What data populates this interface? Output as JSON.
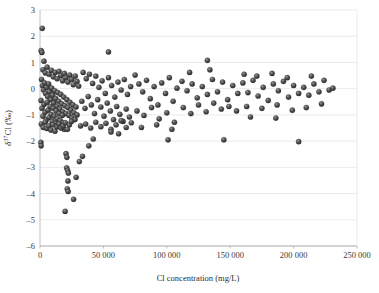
{
  "chart_data": {
    "type": "scatter",
    "title": "",
    "xlabel": "Cl  concentration (mg/L)",
    "ylabel": "δ³⁷Cl (‰)",
    "ylabel_parts": {
      "delta": "δ",
      "superscript": "37",
      "element": "Cl",
      "unit": "(‰)"
    },
    "xlim": [
      0,
      250000
    ],
    "ylim": [
      -6,
      3
    ],
    "xticks": [
      0,
      50000,
      100000,
      150000,
      200000,
      250000
    ],
    "xtick_labels": [
      "0",
      "50 000",
      "100 000",
      "150 000",
      "200 000",
      "250 000"
    ],
    "yticks": [
      3,
      2,
      1,
      0,
      -1,
      -2,
      -3,
      -4,
      -5,
      -6
    ],
    "ytick_labels": [
      "3",
      "2",
      "1",
      "0",
      "–1",
      "–2",
      "–3",
      "–4",
      "–5",
      "–6"
    ],
    "grid": {
      "horizontal": true,
      "vertical": false,
      "color": "#e2e2e2"
    },
    "legend": {
      "visible": false,
      "position": "none"
    },
    "marker": {
      "shape": "sphere",
      "size_px": 5.2,
      "fill": "#4a4a4a",
      "highlight": "#9a9a9a",
      "edge": "#262626"
    },
    "axis_color": "#b9b9b9",
    "series": [
      {
        "name": "samples",
        "points": [
          [
            1800,
            2.3
          ],
          [
            900,
            1.45
          ],
          [
            1500,
            1.38
          ],
          [
            3100,
            1.05
          ],
          [
            54000,
            1.4
          ],
          [
            132000,
            1.08
          ],
          [
            2300,
            0.72
          ],
          [
            4200,
            0.6
          ],
          [
            5600,
            0.82
          ],
          [
            7100,
            0.55
          ],
          [
            9000,
            0.7
          ],
          [
            10500,
            0.45
          ],
          [
            12000,
            0.62
          ],
          [
            13500,
            0.38
          ],
          [
            15000,
            0.66
          ],
          [
            16400,
            0.5
          ],
          [
            17800,
            0.3
          ],
          [
            19200,
            0.58
          ],
          [
            20500,
            0.42
          ],
          [
            22000,
            0.25
          ],
          [
            23500,
            0.52
          ],
          [
            25000,
            0.35
          ],
          [
            26300,
            0.15
          ],
          [
            27800,
            0.48
          ],
          [
            29200,
            0.28
          ],
          [
            30500,
            0.1
          ],
          [
            1200,
            0.35
          ],
          [
            2000,
            0.12
          ],
          [
            2800,
            -0.05
          ],
          [
            3600,
            0.22
          ],
          [
            4400,
            -0.18
          ],
          [
            5200,
            0.05
          ],
          [
            6000,
            -0.3
          ],
          [
            6800,
            0.18
          ],
          [
            7600,
            -0.12
          ],
          [
            8400,
            -0.42
          ],
          [
            9200,
            0.02
          ],
          [
            10000,
            -0.25
          ],
          [
            10800,
            -0.55
          ],
          [
            11600,
            -0.08
          ],
          [
            12400,
            -0.38
          ],
          [
            13200,
            -0.68
          ],
          [
            14000,
            -0.15
          ],
          [
            14800,
            -0.48
          ],
          [
            15600,
            -0.78
          ],
          [
            16400,
            -0.22
          ],
          [
            17200,
            -0.58
          ],
          [
            18000,
            -0.88
          ],
          [
            18800,
            -0.32
          ],
          [
            19600,
            -0.65
          ],
          [
            20400,
            -0.95
          ],
          [
            21200,
            -0.42
          ],
          [
            22000,
            -0.72
          ],
          [
            22800,
            -1.02
          ],
          [
            23600,
            -0.52
          ],
          [
            24400,
            -0.82
          ],
          [
            25200,
            -1.12
          ],
          [
            26000,
            -0.62
          ],
          [
            26800,
            -0.92
          ],
          [
            27600,
            -1.18
          ],
          [
            28400,
            -0.7
          ],
          [
            29200,
            -1.0
          ],
          [
            800,
            -0.45
          ],
          [
            1600,
            -0.75
          ],
          [
            2400,
            -1.05
          ],
          [
            3200,
            -0.6
          ],
          [
            4000,
            -0.9
          ],
          [
            4800,
            -1.2
          ],
          [
            5600,
            -0.52
          ],
          [
            6400,
            -0.82
          ],
          [
            7200,
            -1.1
          ],
          [
            8000,
            -0.68
          ],
          [
            8800,
            -0.98
          ],
          [
            9600,
            -1.25
          ],
          [
            10400,
            -0.75
          ],
          [
            11200,
            -1.05
          ],
          [
            12000,
            -1.32
          ],
          [
            12800,
            -0.85
          ],
          [
            13600,
            -1.15
          ],
          [
            14400,
            -1.4
          ],
          [
            15200,
            -0.95
          ],
          [
            16000,
            -1.22
          ],
          [
            16800,
            -1.48
          ],
          [
            17600,
            -1.02
          ],
          [
            18400,
            -1.3
          ],
          [
            19200,
            -1.55
          ],
          [
            1000,
            -1.35
          ],
          [
            2600,
            -1.48
          ],
          [
            4000,
            -1.28
          ],
          [
            5400,
            -1.52
          ],
          [
            7000,
            -1.42
          ],
          [
            8600,
            -1.58
          ],
          [
            10200,
            -1.38
          ],
          [
            11800,
            -1.62
          ],
          [
            13400,
            -1.45
          ],
          [
            15000,
            -1.35
          ],
          [
            16600,
            -1.5
          ],
          [
            18200,
            -1.42
          ],
          [
            20000,
            -1.3
          ],
          [
            21600,
            -1.55
          ],
          [
            23200,
            -1.38
          ],
          [
            24800,
            -1.25
          ],
          [
            700,
            -2.05
          ],
          [
            900,
            -2.18
          ],
          [
            34000,
            0.62
          ],
          [
            36500,
            0.38
          ],
          [
            39000,
            0.55
          ],
          [
            41500,
            0.2
          ],
          [
            44000,
            0.48
          ],
          [
            46500,
            0.05
          ],
          [
            49000,
            0.3
          ],
          [
            51500,
            -0.18
          ],
          [
            54000,
            0.42
          ],
          [
            56500,
            0.12
          ],
          [
            59000,
            -0.32
          ],
          [
            61500,
            0.25
          ],
          [
            64000,
            -0.05
          ],
          [
            66500,
            0.35
          ],
          [
            69000,
            -0.22
          ],
          [
            71500,
            0.08
          ],
          [
            33000,
            -0.48
          ],
          [
            35500,
            -0.75
          ],
          [
            38000,
            -0.3
          ],
          [
            40500,
            -0.62
          ],
          [
            43000,
            -0.95
          ],
          [
            45500,
            -0.42
          ],
          [
            48000,
            -0.7
          ],
          [
            50500,
            -1.05
          ],
          [
            53000,
            -0.55
          ],
          [
            55500,
            -0.85
          ],
          [
            58000,
            -1.18
          ],
          [
            60500,
            -0.68
          ],
          [
            63000,
            -0.98
          ],
          [
            65500,
            -1.25
          ],
          [
            68000,
            -0.78
          ],
          [
            70500,
            -1.08
          ],
          [
            32000,
            -1.42
          ],
          [
            36000,
            -1.35
          ],
          [
            40000,
            -1.5
          ],
          [
            44000,
            -1.28
          ],
          [
            48000,
            -1.45
          ],
          [
            52000,
            -1.32
          ],
          [
            56000,
            -1.55
          ],
          [
            60000,
            -1.38
          ],
          [
            64000,
            -1.22
          ],
          [
            68000,
            -1.48
          ],
          [
            72000,
            -1.3
          ],
          [
            56000,
            -1.65
          ],
          [
            62000,
            -1.72
          ],
          [
            20500,
            -2.48
          ],
          [
            21200,
            -2.62
          ],
          [
            21000,
            -3.02
          ],
          [
            21800,
            -3.12
          ],
          [
            22400,
            -3.22
          ],
          [
            22000,
            -3.52
          ],
          [
            21500,
            -3.82
          ],
          [
            22200,
            -3.92
          ],
          [
            19800,
            -4.68
          ],
          [
            26500,
            -4.22
          ],
          [
            28500,
            -3.38
          ],
          [
            31000,
            -2.78
          ],
          [
            33500,
            -2.58
          ],
          [
            38500,
            -2.18
          ],
          [
            42000,
            -1.92
          ],
          [
            75000,
            0.52
          ],
          [
            78000,
            0.18
          ],
          [
            81000,
            -0.12
          ],
          [
            84000,
            0.32
          ],
          [
            87000,
            -0.38
          ],
          [
            90000,
            0.08
          ],
          [
            93000,
            -0.62
          ],
          [
            96000,
            0.22
          ],
          [
            99000,
            -0.18
          ],
          [
            102000,
            0.42
          ],
          [
            105000,
            -0.48
          ],
          [
            108000,
            0.02
          ],
          [
            76500,
            -0.85
          ],
          [
            82000,
            -1.02
          ],
          [
            88000,
            -0.72
          ],
          [
            94000,
            -1.15
          ],
          [
            100000,
            -0.92
          ],
          [
            106000,
            -1.28
          ],
          [
            80000,
            -1.48
          ],
          [
            92000,
            -1.38
          ],
          [
            104000,
            -1.55
          ],
          [
            101000,
            -1.95
          ],
          [
            112000,
            0.28
          ],
          [
            116000,
            -0.08
          ],
          [
            120000,
            0.18
          ],
          [
            124000,
            -0.35
          ],
          [
            128000,
            0.08
          ],
          [
            132000,
            -0.22
          ],
          [
            136000,
            0.35
          ],
          [
            140000,
            -0.12
          ],
          [
            144000,
            0.25
          ],
          [
            148000,
            -0.42
          ],
          [
            152000,
            0.12
          ],
          [
            156000,
            -0.18
          ],
          [
            113000,
            -0.72
          ],
          [
            119000,
            -0.95
          ],
          [
            125000,
            -0.62
          ],
          [
            131000,
            -0.88
          ],
          [
            137000,
            -0.55
          ],
          [
            143000,
            -0.78
          ],
          [
            149000,
            -0.68
          ],
          [
            155000,
            -0.85
          ],
          [
            118000,
            0.62
          ],
          [
            134000,
            0.72
          ],
          [
            160000,
            0.22
          ],
          [
            164000,
            -0.15
          ],
          [
            168000,
            0.32
          ],
          [
            172000,
            -0.28
          ],
          [
            176000,
            0.05
          ],
          [
            180000,
            -0.45
          ],
          [
            184000,
            0.18
          ],
          [
            188000,
            -0.08
          ],
          [
            192000,
            0.28
          ],
          [
            196000,
            -0.32
          ],
          [
            200000,
            0.12
          ],
          [
            204000,
            -0.18
          ],
          [
            161000,
            0.55
          ],
          [
            171000,
            0.48
          ],
          [
            183000,
            0.58
          ],
          [
            195000,
            0.42
          ],
          [
            163000,
            -0.68
          ],
          [
            175000,
            -0.75
          ],
          [
            187000,
            -0.62
          ],
          [
            199000,
            -0.82
          ],
          [
            166000,
            -1.08
          ],
          [
            186000,
            -1.12
          ],
          [
            208000,
            0.05
          ],
          [
            212000,
            -0.25
          ],
          [
            216000,
            0.18
          ],
          [
            220000,
            -0.12
          ],
          [
            224000,
            0.32
          ],
          [
            228000,
            -0.05
          ],
          [
            210000,
            -0.72
          ],
          [
            222000,
            -0.58
          ],
          [
            214000,
            0.48
          ],
          [
            231000,
            0.02
          ],
          [
            145000,
            -1.95
          ],
          [
            204000,
            -2.02
          ]
        ]
      }
    ]
  },
  "plot_geometry": {
    "left_px": 40,
    "right_px": 357,
    "top_px": 10,
    "bottom_px": 246
  }
}
